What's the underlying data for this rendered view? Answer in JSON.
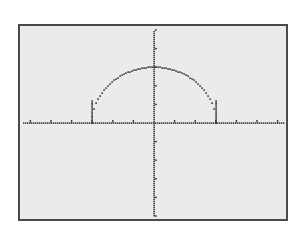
{
  "chart_data": {
    "type": "scatter",
    "title": "",
    "function": "y = sqrt(9 - x^2)",
    "xlabel": "",
    "ylabel": "",
    "xlim": [
      -6,
      6
    ],
    "ylim": [
      -5,
      5.5
    ],
    "xscl": 1,
    "yscl": 1,
    "grid": false,
    "legend": null,
    "x_ticks": [
      -6,
      -5,
      -4,
      -3,
      -2,
      -1,
      1,
      2,
      3,
      4,
      5,
      6
    ],
    "y_ticks": [
      -5,
      -4,
      -3,
      -2,
      -1,
      1,
      2,
      3,
      4,
      5
    ],
    "series": [
      {
        "name": "semicircle",
        "x": [
          -3,
          -2.9,
          -2.8,
          -2.6,
          -2.4,
          -2.2,
          -2,
          -1.8,
          -1.5,
          -1.2,
          -0.9,
          -0.5,
          0,
          0.5,
          0.9,
          1.2,
          1.5,
          1.8,
          2,
          2.2,
          2.4,
          2.6,
          2.8,
          2.9,
          3
        ],
        "y": [
          0,
          0.77,
          1.08,
          1.5,
          1.8,
          2.04,
          2.24,
          2.4,
          2.6,
          2.75,
          2.86,
          2.96,
          3,
          2.96,
          2.86,
          2.75,
          2.6,
          2.4,
          2.24,
          2.04,
          1.8,
          1.5,
          1.08,
          0.77,
          0
        ]
      }
    ],
    "colors": {
      "screen": "#ebebeb",
      "pixels": "#3a3a3a",
      "frame": "#4a4a4a"
    }
  }
}
